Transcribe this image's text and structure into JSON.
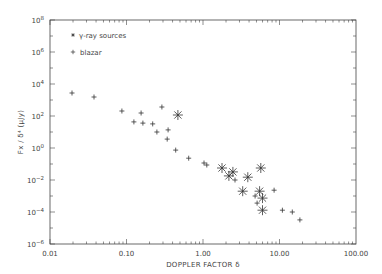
{
  "chart_data": {
    "type": "scatter",
    "title": "",
    "xlabel": "DOPPLER FACTOR δ",
    "ylabel": "Fx / δ⁴ (μJy)",
    "xscale": "log",
    "yscale": "log",
    "xlim": [
      0.01,
      100
    ],
    "ylim": [
      1e-06,
      100000000.0
    ],
    "x_tick_labels": [
      "0.01",
      "0.10",
      "1.00",
      "10.00",
      "100.00"
    ],
    "y_tick_labels": [
      "10^-6",
      "10^-4",
      "10^-2",
      "10^0",
      "10^2",
      "10^4",
      "10^6",
      "10^8"
    ],
    "grid": false,
    "legend": {
      "position": "upper left",
      "entries": [
        {
          "marker": "*",
          "label": "γ-ray sources"
        },
        {
          "marker": "+",
          "label": "blazar"
        }
      ]
    },
    "series": [
      {
        "name": "γ-ray sources",
        "marker": "asterisk",
        "points": [
          {
            "x": 0.47,
            "y": 115
          },
          {
            "x": 1.77,
            "y": 0.056
          },
          {
            "x": 2.18,
            "y": 0.018
          },
          {
            "x": 2.46,
            "y": 0.032
          },
          {
            "x": 3.85,
            "y": 0.015
          },
          {
            "x": 5.7,
            "y": 0.056
          },
          {
            "x": 3.3,
            "y": 0.002
          },
          {
            "x": 5.5,
            "y": 0.002
          },
          {
            "x": 6.0,
            "y": 0.00074
          },
          {
            "x": 6.0,
            "y": 0.00013
          }
        ]
      },
      {
        "name": "blazar",
        "marker": "plus",
        "points": [
          {
            "x": 0.0194,
            "y": 2750
          },
          {
            "x": 0.0376,
            "y": 1550
          },
          {
            "x": 0.087,
            "y": 204
          },
          {
            "x": 0.155,
            "y": 155
          },
          {
            "x": 0.29,
            "y": 363
          },
          {
            "x": 0.125,
            "y": 43
          },
          {
            "x": 0.164,
            "y": 36
          },
          {
            "x": 0.22,
            "y": 32
          },
          {
            "x": 0.25,
            "y": 10
          },
          {
            "x": 0.35,
            "y": 13.5
          },
          {
            "x": 0.34,
            "y": 3.6
          },
          {
            "x": 0.44,
            "y": 0.74
          },
          {
            "x": 0.65,
            "y": 0.23
          },
          {
            "x": 1.03,
            "y": 0.115
          },
          {
            "x": 1.12,
            "y": 0.087
          },
          {
            "x": 2.62,
            "y": 0.01
          },
          {
            "x": 8.5,
            "y": 0.0023
          },
          {
            "x": 4.8,
            "y": 0.001
          },
          {
            "x": 5.1,
            "y": 0.00036
          },
          {
            "x": 10.9,
            "y": 0.00013
          },
          {
            "x": 14.7,
            "y": 0.0001
          },
          {
            "x": 18.5,
            "y": 3.2e-05
          }
        ]
      }
    ]
  },
  "labels": {
    "xlabel": "DOPPLER FACTOR δ",
    "ylabel": "Fx / δ⁴ (μJy)",
    "legend_gamma": "γ-ray sources",
    "legend_blazar": "blazar",
    "x_ticks": [
      "0.01",
      "0.10",
      "1.00",
      "10.00",
      "100.00"
    ],
    "y_ticks": [
      {
        "base": "10",
        "exp": "8"
      },
      {
        "base": "10",
        "exp": "6"
      },
      {
        "base": "10",
        "exp": "4"
      },
      {
        "base": "10",
        "exp": "2"
      },
      {
        "base": "10",
        "exp": "0"
      },
      {
        "base": "10",
        "exp": "−2"
      },
      {
        "base": "10",
        "exp": "−4"
      },
      {
        "base": "10",
        "exp": "−6"
      }
    ]
  },
  "style": {
    "axis_color": "#444444",
    "marker_color": "#333333"
  }
}
